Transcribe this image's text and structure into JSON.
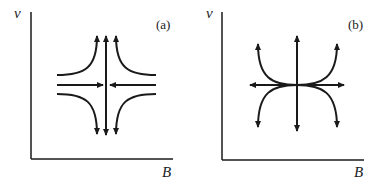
{
  "panels": [
    {
      "id": "a",
      "label": "(a)",
      "y_axis_label": "v",
      "x_axis_label": "B",
      "description": "Saddle point: flow converges horizontally toward center and diverges vertically; hyperbolic trajectories in four quadrants"
    },
    {
      "id": "b",
      "label": "(b)",
      "y_axis_label": "v",
      "x_axis_label": "B",
      "description": "Unstable node: all trajectories diverge from center; curved trajectories tangent to horizontal axis at center"
    }
  ],
  "colors": {
    "stroke": "#1a1a1a",
    "background": "#ffffff"
  }
}
